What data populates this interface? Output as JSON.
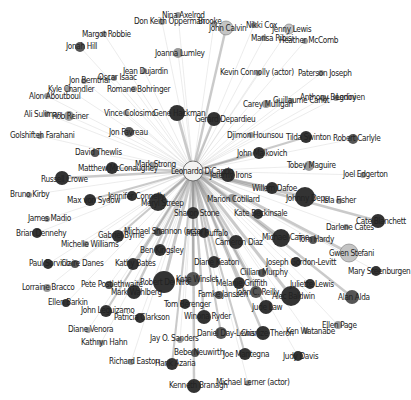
{
  "graph": {
    "title": "Leonardo DiCaprio co-star network",
    "hub": {
      "id": "leonardo-dicaprio",
      "label": "Leonardo DiCaprio",
      "x": 193,
      "y": 171,
      "r": 10
    },
    "colors": {
      "background": "#ffffff",
      "edge": "#c8c8c8",
      "edge_strong": "#8a8a8a",
      "node_dark": "#333333",
      "node_mid": "#555555",
      "node_light": "#9a9a9a",
      "node_pale": "#c4c4c4",
      "label": "#222222"
    },
    "nodes": [
      {
        "label": "Nina Axelrod",
        "x": 178,
        "y": 15,
        "r": 3,
        "tone": "light",
        "lx": 162,
        "ly": 18
      },
      {
        "label": "Don Keith Opperman",
        "x": 162,
        "y": 22,
        "r": 3,
        "tone": "light",
        "lx": 134,
        "ly": 24
      },
      {
        "label": "Brooke",
        "x": 214,
        "y": 24,
        "r": 3,
        "tone": "light",
        "lx": 198,
        "ly": 24
      },
      {
        "label": "John Calvin",
        "x": 226,
        "y": 28,
        "r": 7,
        "tone": "pale",
        "lx": 209,
        "ly": 31
      },
      {
        "label": "Nikki Cox",
        "x": 254,
        "y": 25,
        "r": 3,
        "tone": "light",
        "lx": 246,
        "ly": 28
      },
      {
        "label": "Jenny Lewis",
        "x": 289,
        "y": 29,
        "r": 5,
        "tone": "pale",
        "lx": 272,
        "ly": 32
      },
      {
        "label": "Marisa Ribisi",
        "x": 264,
        "y": 38,
        "r": 3,
        "tone": "light",
        "lx": 251,
        "ly": 41
      },
      {
        "label": "Heather McComb",
        "x": 305,
        "y": 41,
        "r": 3,
        "tone": "light",
        "lx": 279,
        "ly": 43
      },
      {
        "label": "Margot Robbie",
        "x": 104,
        "y": 34,
        "r": 3,
        "tone": "light",
        "lx": 82,
        "ly": 37
      },
      {
        "label": "Jonah Hill",
        "x": 80,
        "y": 47,
        "r": 5,
        "tone": "mid",
        "lx": 66,
        "ly": 49
      },
      {
        "label": "Joanna Lumley",
        "x": 178,
        "y": 53,
        "r": 5,
        "tone": "light",
        "lx": 155,
        "ly": 56
      },
      {
        "label": "Jean Dujardin",
        "x": 144,
        "y": 71,
        "r": 3,
        "tone": "light",
        "lx": 123,
        "ly": 74
      },
      {
        "label": "Oscar Isaac",
        "x": 114,
        "y": 78,
        "r": 3,
        "tone": "light",
        "lx": 98,
        "ly": 80
      },
      {
        "label": "Jon Bernthal",
        "x": 84,
        "y": 81,
        "r": 3,
        "tone": "light",
        "lx": 69,
        "ly": 83
      },
      {
        "label": "Kyle Chandler",
        "x": 68,
        "y": 89,
        "r": 3,
        "tone": "light",
        "lx": 48,
        "ly": 92
      },
      {
        "label": "Romane Bohringer",
        "x": 134,
        "y": 89,
        "r": 3,
        "tone": "light",
        "lx": 107,
        "ly": 92
      },
      {
        "label": "Alon Aboutboul",
        "x": 47,
        "y": 96,
        "r": 3,
        "tone": "light",
        "lx": 29,
        "ly": 99
      },
      {
        "label": "Kevin Connolly (actor)",
        "x": 258,
        "y": 73,
        "r": 3,
        "tone": "light",
        "lx": 220,
        "ly": 75
      },
      {
        "label": "Paterson Joseph",
        "x": 321,
        "y": 73,
        "r": 3,
        "tone": "light",
        "lx": 298,
        "ly": 76
      },
      {
        "label": "Ali Suliman",
        "x": 47,
        "y": 114,
        "r": 3,
        "tone": "light",
        "lx": 24,
        "ly": 117
      },
      {
        "label": "Rob Reiner",
        "x": 69,
        "y": 116,
        "r": 5,
        "tone": "light",
        "lx": 52,
        "ly": 119
      },
      {
        "label": "Vince Colosimo",
        "x": 126,
        "y": 113,
        "r": 3,
        "tone": "light",
        "lx": 104,
        "ly": 116
      },
      {
        "label": "Gene Hackman",
        "x": 177,
        "y": 113,
        "r": 8,
        "tone": "dark",
        "lx": 153,
        "ly": 116
      },
      {
        "label": "Gerard Depardieu",
        "x": 214,
        "y": 119,
        "r": 7,
        "tone": "dark",
        "lx": 195,
        "ly": 122
      },
      {
        "label": "Carey Mulligan",
        "x": 266,
        "y": 104,
        "r": 4,
        "tone": "light",
        "lx": 243,
        "ly": 107
      },
      {
        "label": "Guillaume Canet",
        "x": 291,
        "y": 101,
        "r": 3,
        "tone": "light",
        "lx": 273,
        "ly": 103
      },
      {
        "label": "Anthony Begnini",
        "x": 323,
        "y": 98,
        "r": 3,
        "tone": "light",
        "lx": 300,
        "ly": 100
      },
      {
        "label": "Ledoyen",
        "x": 336,
        "y": 98,
        "r": 3,
        "tone": "light",
        "lx": 336,
        "ly": 100
      },
      {
        "label": "Jon Favreau",
        "x": 129,
        "y": 132,
        "r": 5,
        "tone": "mid",
        "lx": 109,
        "ly": 135
      },
      {
        "label": "Golshifteh Farahani",
        "x": 40,
        "y": 136,
        "r": 3,
        "tone": "light",
        "lx": 10,
        "ly": 138
      },
      {
        "label": "Djimon Hounsou",
        "x": 251,
        "y": 135,
        "r": 3,
        "tone": "light",
        "lx": 227,
        "ly": 138
      },
      {
        "label": "Tilda Swinton",
        "x": 306,
        "y": 137,
        "r": 6,
        "tone": "dark",
        "lx": 286,
        "ly": 140
      },
      {
        "label": "Robert Carlyle",
        "x": 353,
        "y": 139,
        "r": 5,
        "tone": "mid",
        "lx": 333,
        "ly": 141
      },
      {
        "label": "David Thewlis",
        "x": 95,
        "y": 153,
        "r": 4,
        "tone": "mid",
        "lx": 75,
        "ly": 155
      },
      {
        "label": "John Malkovich",
        "x": 259,
        "y": 153,
        "r": 6,
        "tone": "dark",
        "lx": 237,
        "ly": 156
      },
      {
        "label": "Tobey Maguire",
        "x": 309,
        "y": 166,
        "r": 5,
        "tone": "light",
        "lx": 287,
        "ly": 168
      },
      {
        "label": "Mark Strong",
        "x": 153,
        "y": 165,
        "r": 3,
        "tone": "light",
        "lx": 135,
        "ly": 167
      },
      {
        "label": "Matthew McConaughey",
        "x": 112,
        "y": 168,
        "r": 6,
        "tone": "dark",
        "lx": 78,
        "ly": 171
      },
      {
        "label": "Russell Crowe",
        "x": 62,
        "y": 178,
        "r": 7,
        "tone": "dark",
        "lx": 41,
        "ly": 182
      },
      {
        "label": "Jeremy Irons",
        "x": 228,
        "y": 175,
        "r": 7,
        "tone": "dark",
        "lx": 210,
        "ly": 178
      },
      {
        "label": "Joel Edgerton",
        "x": 363,
        "y": 175,
        "r": 3,
        "tone": "light",
        "lx": 343,
        "ly": 177
      },
      {
        "label": "Bruno Kirby",
        "x": 29,
        "y": 195,
        "r": 3,
        "tone": "light",
        "lx": 10,
        "ly": 197
      },
      {
        "label": "Max von Sydow",
        "x": 90,
        "y": 200,
        "r": 6,
        "tone": "dark",
        "lx": 67,
        "ly": 203
      },
      {
        "label": "Jennifer Connelly",
        "x": 132,
        "y": 196,
        "r": 5,
        "tone": "dark",
        "lx": 108,
        "ly": 199
      },
      {
        "label": "Meryl Streep",
        "x": 158,
        "y": 202,
        "r": 9,
        "tone": "dark",
        "lx": 141,
        "ly": 206
      },
      {
        "label": "Willem Dafoe",
        "x": 272,
        "y": 188,
        "r": 6,
        "tone": "dark",
        "lx": 252,
        "ly": 191
      },
      {
        "label": "Marion Cotillard",
        "x": 232,
        "y": 198,
        "r": 4,
        "tone": "light",
        "lx": 207,
        "ly": 202
      },
      {
        "label": "Johnny Depp",
        "x": 305,
        "y": 197,
        "r": 10,
        "tone": "dark",
        "lx": 286,
        "ly": 201
      },
      {
        "label": "Isla Fisher",
        "x": 339,
        "y": 201,
        "r": 3,
        "tone": "light",
        "lx": 323,
        "ly": 203
      },
      {
        "label": "James Madio",
        "x": 47,
        "y": 219,
        "r": 3,
        "tone": "light",
        "lx": 28,
        "ly": 221
      },
      {
        "label": "Sharon Stone",
        "x": 193,
        "y": 213,
        "r": 6,
        "tone": "dark",
        "lx": 174,
        "ly": 216
      },
      {
        "label": "Kate Beckinsale",
        "x": 258,
        "y": 214,
        "r": 5,
        "tone": "dark",
        "lx": 234,
        "ly": 216
      },
      {
        "label": "Brian Dennehy",
        "x": 37,
        "y": 233,
        "r": 5,
        "tone": "dark",
        "lx": 16,
        "ly": 236
      },
      {
        "label": "Gabriel Byrne",
        "x": 118,
        "y": 236,
        "r": 6,
        "tone": "dark",
        "lx": 98,
        "ly": 238
      },
      {
        "label": "Michael Shannon (actor)",
        "x": 158,
        "y": 232,
        "r": 4,
        "tone": "mid",
        "lx": 124,
        "ly": 234
      },
      {
        "label": "Mark Ruffalo",
        "x": 204,
        "y": 233,
        "r": 5,
        "tone": "dark",
        "lx": 186,
        "ly": 236
      },
      {
        "label": "Cate Blanchett",
        "x": 378,
        "y": 221,
        "r": 7,
        "tone": "dark",
        "lx": 356,
        "ly": 224
      },
      {
        "label": "Darlene Cates",
        "x": 346,
        "y": 227,
        "r": 3,
        "tone": "light",
        "lx": 326,
        "ly": 230
      },
      {
        "label": "Michelle Williams",
        "x": 86,
        "y": 244,
        "r": 3,
        "tone": "light",
        "lx": 61,
        "ly": 247
      },
      {
        "label": "Cameron Diaz",
        "x": 236,
        "y": 242,
        "r": 7,
        "tone": "dark",
        "lx": 215,
        "ly": 245
      },
      {
        "label": "Michael Caine",
        "x": 281,
        "y": 238,
        "r": 9,
        "tone": "dark",
        "lx": 262,
        "ly": 240
      },
      {
        "label": "Tom Hardy",
        "x": 313,
        "y": 240,
        "r": 4,
        "tone": "mid",
        "lx": 298,
        "ly": 242
      },
      {
        "label": "Ben Kingsley",
        "x": 160,
        "y": 250,
        "r": 6,
        "tone": "dark",
        "lx": 140,
        "ly": 253
      },
      {
        "label": "Gwen Stefani",
        "x": 349,
        "y": 253,
        "r": 9,
        "tone": "pale",
        "lx": 329,
        "ly": 256
      },
      {
        "label": "Paul Sorvino",
        "x": 48,
        "y": 264,
        "r": 5,
        "tone": "dark",
        "lx": 29,
        "ly": 266
      },
      {
        "label": "Claire Danes",
        "x": 75,
        "y": 264,
        "r": 4,
        "tone": "mid",
        "lx": 61,
        "ly": 266
      },
      {
        "label": "Kathy Bates",
        "x": 133,
        "y": 264,
        "r": 6,
        "tone": "dark",
        "lx": 115,
        "ly": 266
      },
      {
        "label": "Diane Keaton",
        "x": 214,
        "y": 262,
        "r": 6,
        "tone": "dark",
        "lx": 194,
        "ly": 265
      },
      {
        "label": "Joseph Gordon-Levitt",
        "x": 296,
        "y": 262,
        "r": 5,
        "tone": "dark",
        "lx": 266,
        "ly": 265
      },
      {
        "label": "Mary Steenburgen",
        "x": 376,
        "y": 271,
        "r": 5,
        "tone": "dark",
        "lx": 348,
        "ly": 274
      },
      {
        "label": "Cillian Murphy",
        "x": 262,
        "y": 273,
        "r": 4,
        "tone": "mid",
        "lx": 240,
        "ly": 275
      },
      {
        "label": "Robert De Niro",
        "x": 164,
        "y": 282,
        "r": 11,
        "tone": "dark",
        "lx": 140,
        "ly": 285
      },
      {
        "label": "Kate Winslet",
        "x": 193,
        "y": 279,
        "r": 7,
        "tone": "mid",
        "lx": 176,
        "ly": 282
      },
      {
        "label": "Melanie Griffith",
        "x": 239,
        "y": 283,
        "r": 6,
        "tone": "dark",
        "lx": 216,
        "ly": 286
      },
      {
        "label": "Juliette Lewis",
        "x": 310,
        "y": 284,
        "r": 5,
        "tone": "dark",
        "lx": 290,
        "ly": 287
      },
      {
        "label": "Lorraine Bracco",
        "x": 47,
        "y": 288,
        "r": 4,
        "tone": "light",
        "lx": 22,
        "ly": 290
      },
      {
        "label": "Pete Postlethwaite",
        "x": 109,
        "y": 285,
        "r": 4,
        "tone": "mid",
        "lx": 81,
        "ly": 287
      },
      {
        "label": "Mark Wahlberg",
        "x": 134,
        "y": 292,
        "r": 7,
        "tone": "dark",
        "lx": 111,
        "ly": 295
      },
      {
        "label": "Famke Janssen",
        "x": 219,
        "y": 295,
        "r": 4,
        "tone": "mid",
        "lx": 198,
        "ly": 297
      },
      {
        "label": "John C. Reilly",
        "x": 256,
        "y": 292,
        "r": 6,
        "tone": "mid",
        "lx": 236,
        "ly": 295
      },
      {
        "label": "Alec Baldwin",
        "x": 291,
        "y": 296,
        "r": 10,
        "tone": "dark",
        "lx": 272,
        "ly": 299
      },
      {
        "label": "Alan Alda",
        "x": 352,
        "y": 297,
        "r": 7,
        "tone": "mid",
        "lx": 338,
        "ly": 300
      },
      {
        "label": "Ellen Barkin",
        "x": 66,
        "y": 303,
        "r": 4,
        "tone": "dark",
        "lx": 48,
        "ly": 305
      },
      {
        "label": "Tom Berenger",
        "x": 185,
        "y": 304,
        "r": 5,
        "tone": "dark",
        "lx": 164,
        "ly": 307
      },
      {
        "label": "John Leguizamo",
        "x": 106,
        "y": 311,
        "r": 6,
        "tone": "dark",
        "lx": 81,
        "ly": 313
      },
      {
        "label": "Jude Law",
        "x": 266,
        "y": 307,
        "r": 7,
        "tone": "dark",
        "lx": 252,
        "ly": 310
      },
      {
        "label": "Patricia Clarkson",
        "x": 140,
        "y": 318,
        "r": 5,
        "tone": "dark",
        "lx": 114,
        "ly": 320
      },
      {
        "label": "Winona Ryder",
        "x": 204,
        "y": 317,
        "r": 7,
        "tone": "dark",
        "lx": 184,
        "ly": 319
      },
      {
        "label": "Ellen Page",
        "x": 338,
        "y": 325,
        "r": 4,
        "tone": "light",
        "lx": 322,
        "ly": 328
      },
      {
        "label": "Diane Venora",
        "x": 88,
        "y": 330,
        "r": 3,
        "tone": "light",
        "lx": 68,
        "ly": 332
      },
      {
        "label": "Daniel Day-Lewis",
        "x": 221,
        "y": 333,
        "r": 6,
        "tone": "mid",
        "lx": 197,
        "ly": 336
      },
      {
        "label": "Charlize Theron",
        "x": 263,
        "y": 333,
        "r": 7,
        "tone": "dark",
        "lx": 241,
        "ly": 336
      },
      {
        "label": "Ken Watanabe",
        "x": 306,
        "y": 331,
        "r": 3,
        "tone": "light",
        "lx": 286,
        "ly": 334
      },
      {
        "label": "Jay O. Sanders",
        "x": 180,
        "y": 340,
        "r": 3,
        "tone": "light",
        "lx": 150,
        "ly": 341
      },
      {
        "label": "Kathryn Hahn",
        "x": 101,
        "y": 343,
        "r": 3,
        "tone": "light",
        "lx": 81,
        "ly": 345
      },
      {
        "label": "Bebe Neuwirth",
        "x": 195,
        "y": 353,
        "r": 4,
        "tone": "mid",
        "lx": 174,
        "ly": 355
      },
      {
        "label": "Joe Mantegna",
        "x": 245,
        "y": 354,
        "r": 6,
        "tone": "dark",
        "lx": 223,
        "ly": 357
      },
      {
        "label": "Judy Davis",
        "x": 298,
        "y": 356,
        "r": 5,
        "tone": "dark",
        "lx": 283,
        "ly": 359
      },
      {
        "label": "Richard Easton",
        "x": 131,
        "y": 362,
        "r": 3,
        "tone": "light",
        "lx": 109,
        "ly": 364
      },
      {
        "label": "Hank Azaria",
        "x": 172,
        "y": 364,
        "r": 6,
        "tone": "dark",
        "lx": 155,
        "ly": 366
      },
      {
        "label": "Kenneth Branagh",
        "x": 194,
        "y": 386,
        "r": 7,
        "tone": "dark",
        "lx": 169,
        "ly": 388
      },
      {
        "label": "Michael Lerner (actor)",
        "x": 248,
        "y": 383,
        "r": 3,
        "tone": "light",
        "lx": 216,
        "ly": 385
      }
    ]
  }
}
